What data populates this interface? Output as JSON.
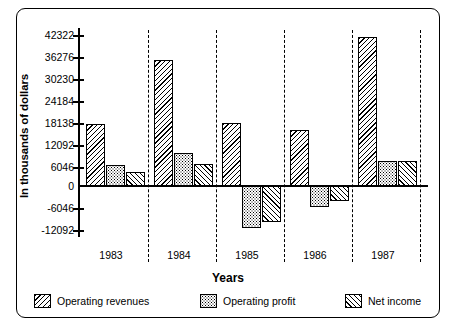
{
  "chart_data": {
    "type": "bar",
    "title": "",
    "xlabel": "Years",
    "ylabel": "In thousands of dollars",
    "categories": [
      "1983",
      "1984",
      "1985",
      "1986",
      "1987"
    ],
    "ytick_labels": [
      "42322",
      "36276",
      "30230",
      "24184",
      "18138",
      "12092",
      "6046",
      "0",
      "-6046",
      "-12092"
    ],
    "ytick_values": [
      42322,
      36276,
      30230,
      24184,
      18138,
      12092,
      6046,
      0,
      -6046,
      -12092
    ],
    "ylim": [
      -12092,
      42322
    ],
    "grid": false,
    "legend_position": "bottom",
    "series": [
      {
        "name": "Operating revenues",
        "pattern": "backslash-hatch",
        "values": [
          17000,
          34600,
          17200,
          15500,
          41000
        ]
      },
      {
        "name": "Operating profit",
        "pattern": "dot-stipple",
        "values": [
          5800,
          9000,
          -11500,
          -5800,
          7000
        ]
      },
      {
        "name": "Net income",
        "pattern": "forwardslash-hatch",
        "values": [
          3900,
          6100,
          -10000,
          -4000,
          7000
        ]
      }
    ]
  },
  "axes": {
    "y_title": "In thousands of dollars",
    "x_title": "Years"
  },
  "legend": {
    "items": [
      {
        "label": "Operating revenues",
        "swatch": "backslash-hatch-swatch"
      },
      {
        "label": "Operating profit",
        "swatch": "dot-stipple-swatch"
      },
      {
        "label": "Net income",
        "swatch": "forwardslash-hatch-swatch"
      }
    ]
  },
  "colors": {
    "ink": "#000000",
    "background": "#ffffff"
  }
}
